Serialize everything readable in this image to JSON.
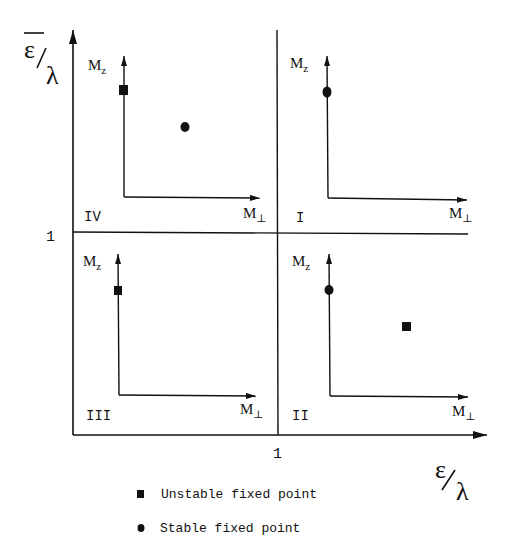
{
  "diagram": {
    "type": "phase-diagram",
    "x_axis": {
      "label_num": "ε",
      "label_den": "λ",
      "tick": "1"
    },
    "y_axis": {
      "label_num": "ε",
      "label_den": "λ",
      "overline": true,
      "tick": "1"
    },
    "quadrants": [
      {
        "id": "I",
        "label": "I",
        "axis_y_label": "M",
        "axis_y_sub": "z",
        "axis_x_label": "M",
        "axis_x_sub": "⊥",
        "points": [
          {
            "type": "stable",
            "position": "on M_z axis"
          }
        ]
      },
      {
        "id": "II",
        "label": "II",
        "axis_y_label": "M",
        "axis_y_sub": "z",
        "axis_x_label": "M",
        "axis_x_sub": "⊥",
        "points": [
          {
            "type": "stable",
            "position": "on M_z axis"
          },
          {
            "type": "unstable",
            "position": "interior"
          }
        ]
      },
      {
        "id": "III",
        "label": "III",
        "axis_y_label": "M",
        "axis_y_sub": "z",
        "axis_x_label": "M",
        "axis_x_sub": "⊥",
        "points": [
          {
            "type": "unstable",
            "position": "on M_z axis"
          }
        ]
      },
      {
        "id": "IV",
        "label": "IV",
        "axis_y_label": "M",
        "axis_y_sub": "z",
        "axis_x_label": "M",
        "axis_x_sub": "⊥",
        "points": [
          {
            "type": "unstable",
            "position": "on M_z axis"
          },
          {
            "type": "stable",
            "position": "interior"
          }
        ]
      }
    ]
  },
  "legend": {
    "items": [
      {
        "symbol": "square",
        "label": "Unstable fixed point"
      },
      {
        "symbol": "circle",
        "label": "Stable fixed point"
      }
    ]
  },
  "colors": {
    "ink": "#111111",
    "background": "#ffffff"
  }
}
